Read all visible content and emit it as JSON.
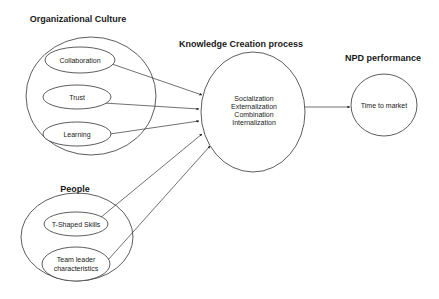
{
  "diagram": {
    "groups": {
      "org_culture": {
        "title": "Organizational Culture",
        "items": [
          "Collaboration",
          "Trust",
          "Learning"
        ]
      },
      "people": {
        "title": "People",
        "items": [
          "T-Shaped Skills",
          "Team leader",
          "characteristics"
        ]
      },
      "knowledge": {
        "title": "Knowledge  Creation process",
        "lines": [
          "Socialization",
          "Externalization",
          "Combination",
          "Internalization"
        ]
      },
      "npd": {
        "title": "NPD performance",
        "label": "Time to market"
      }
    },
    "edges": [
      {
        "from": "Collaboration",
        "to": "Knowledge Creation process"
      },
      {
        "from": "Trust",
        "to": "Knowledge Creation process"
      },
      {
        "from": "Learning",
        "to": "Knowledge Creation process"
      },
      {
        "from": "T-Shaped Skills",
        "to": "Knowledge Creation process"
      },
      {
        "from": "Team leader characteristics",
        "to": "Knowledge Creation process"
      },
      {
        "from": "Knowledge Creation process",
        "to": "Time to market"
      }
    ],
    "colors": {
      "stroke": "#333333",
      "text": "#222222",
      "background": "#ffffff"
    }
  }
}
